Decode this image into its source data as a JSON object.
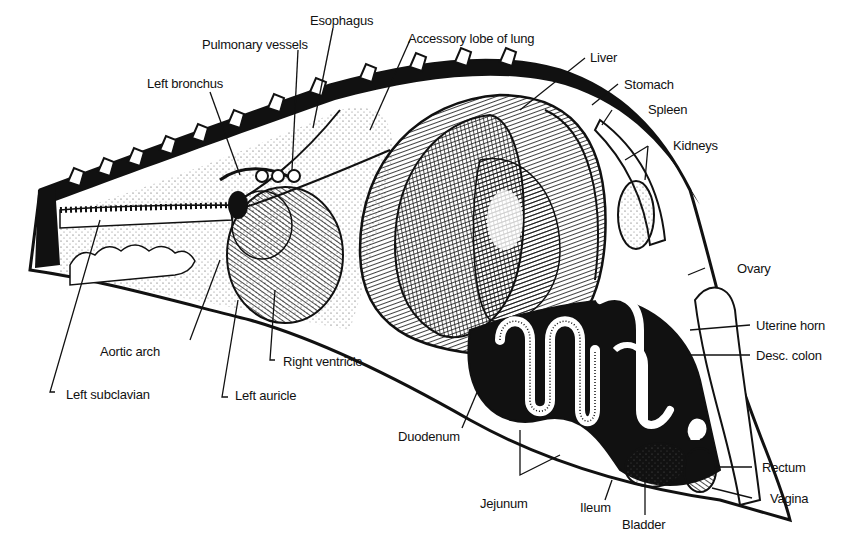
{
  "figure": {
    "colors": {
      "ink": "#111111",
      "paper": "#ffffff",
      "stipple": "#bdbdbd",
      "shade": "#2a2a2a"
    }
  },
  "labels": {
    "esophagus": "Esophagus",
    "pulmonary_vessels": "Pulmonary vessels",
    "accessory_lobe": "Accessory lobe of lung",
    "left_bronchus": "Left bronchus",
    "liver": "Liver",
    "stomach": "Stomach",
    "spleen": "Spleen",
    "kidneys": "Kidneys",
    "ovary": "Ovary",
    "uterine_horn": "Uterine horn",
    "desc_colon": "Desc. colon",
    "aortic_arch": "Aortic arch",
    "right_ventricle": "Right ventricle",
    "left_subclavian": "Left subclavian",
    "left_auricle": "Left auricle",
    "duodenum": "Duodenum",
    "jejunum": "Jejunum",
    "ileum": "Ileum",
    "bladder": "Bladder",
    "rectum": "Rectum",
    "vagina": "Vagina"
  }
}
